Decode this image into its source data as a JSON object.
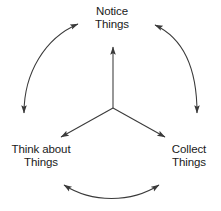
{
  "diagram": {
    "type": "cycle",
    "line_color": "#3a3a3a",
    "text_color": "#1a1a1a",
    "background": "#ffffff",
    "nodes": [
      {
        "id": "notice",
        "position": "top",
        "line1": "Notice",
        "line2": "Things"
      },
      {
        "id": "think",
        "position": "bottom-left",
        "line1": "Think about",
        "line2": "Things"
      },
      {
        "id": "collect",
        "position": "bottom-right",
        "line1": "Collect",
        "line2": "Things"
      }
    ],
    "hub": {
      "id": "center-hub",
      "description": "three-way radiating arrow from center to each node"
    },
    "connectors": [
      {
        "id": "arc-left",
        "from": "think",
        "to": "notice",
        "style": "curved",
        "arrowheads": "both"
      },
      {
        "id": "arc-right",
        "from": "notice",
        "to": "collect",
        "style": "curved",
        "arrowheads": "both"
      },
      {
        "id": "arc-bottom",
        "from": "think",
        "to": "collect",
        "style": "curved",
        "arrowheads": "both"
      },
      {
        "id": "spoke-up",
        "from": "center-hub",
        "to": "notice",
        "style": "straight",
        "arrowheads": "end"
      },
      {
        "id": "spoke-down-left",
        "from": "center-hub",
        "to": "think",
        "style": "straight",
        "arrowheads": "end"
      },
      {
        "id": "spoke-down-right",
        "from": "center-hub",
        "to": "collect",
        "style": "straight",
        "arrowheads": "end"
      }
    ]
  }
}
